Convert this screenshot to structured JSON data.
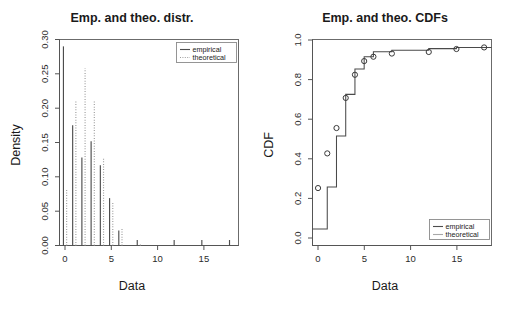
{
  "figure": {
    "panels": [
      "density-panel",
      "cdf-panel"
    ]
  },
  "left_panel": {
    "title": "Emp. and theo. distr.",
    "xlabel": "Data",
    "ylabel": "Density",
    "legend": {
      "empirical_label": "empirical",
      "theoretical_label": "theoretical"
    }
  },
  "right_panel": {
    "title": "Emp. and theo. CDFs",
    "xlabel": "Data",
    "ylabel": "CDF",
    "legend": {
      "empirical_label": "empirical",
      "theoretical_label": "theoretical"
    }
  },
  "colors": {
    "empirical": "#4d4d4d",
    "theoretical": "#9e9e9e",
    "axis": "#555555",
    "frame": "#6b6b6b",
    "text": "#1a1a1a"
  },
  "chart_data": [
    {
      "type": "bar",
      "id": "density-panel",
      "title": "Emp. and theo. distr.",
      "xlabel": "Data",
      "ylabel": "Density",
      "xlim": [
        -0.6,
        18.8
      ],
      "ylim": [
        0.0,
        0.3
      ],
      "xticks": [
        0,
        5,
        10,
        15
      ],
      "yticks": [
        0.0,
        0.05,
        0.1,
        0.15,
        0.2,
        0.25,
        0.3
      ],
      "ytick_labels": [
        "0.00",
        "0.05",
        "0.10",
        "0.15",
        "0.20",
        "0.25",
        "0.30"
      ],
      "xtick_labels": [
        "0",
        "5",
        "10",
        "15"
      ],
      "grid": false,
      "legend_position": "top-right",
      "categories": [
        0,
        1,
        2,
        3,
        4,
        5,
        6,
        8,
        12,
        15,
        18
      ],
      "series": [
        {
          "name": "empirical",
          "style": "solid",
          "values": [
            0.29,
            0.175,
            0.128,
            0.152,
            0.117,
            0.069,
            0.022,
            0.008,
            0.008,
            0.008,
            0.008
          ]
        },
        {
          "name": "theoretical",
          "style": "dotted",
          "values": [
            0.083,
            0.212,
            0.258,
            0.21,
            0.128,
            0.062,
            0.025,
            0.002,
            0.0,
            0.0,
            0.0
          ]
        }
      ]
    },
    {
      "type": "line",
      "id": "cdf-panel",
      "title": "Emp. and theo. CDFs",
      "xlabel": "Data",
      "ylabel": "CDF",
      "xlim": [
        -0.6,
        18.8
      ],
      "ylim": [
        0.0,
        1.04
      ],
      "xticks": [
        0,
        5,
        10,
        15
      ],
      "yticks": [
        0.0,
        0.2,
        0.4,
        0.6,
        0.8,
        1.0
      ],
      "ytick_labels": [
        "0.0",
        "0.2",
        "0.4",
        "0.6",
        "0.8",
        "1.0"
      ],
      "xtick_labels": [
        "0",
        "5",
        "10",
        "15"
      ],
      "grid": false,
      "legend_position": "bottom-right",
      "series": [
        {
          "name": "empirical",
          "style": "step",
          "x": [
            0,
            1,
            2,
            3,
            4,
            5,
            6,
            8,
            12,
            15,
            18
          ],
          "y": [
            0.083,
            0.295,
            0.553,
            0.763,
            0.891,
            0.953,
            0.978,
            0.986,
            0.994,
            1.0,
            1.0
          ]
        },
        {
          "name": "theoretical",
          "style": "points",
          "x": [
            0,
            1,
            2,
            3,
            4,
            5,
            6,
            8,
            12,
            15,
            18
          ],
          "y": [
            0.29,
            0.465,
            0.593,
            0.745,
            0.862,
            0.931,
            0.953,
            0.969,
            0.977,
            0.992,
            1.0
          ]
        }
      ]
    }
  ]
}
